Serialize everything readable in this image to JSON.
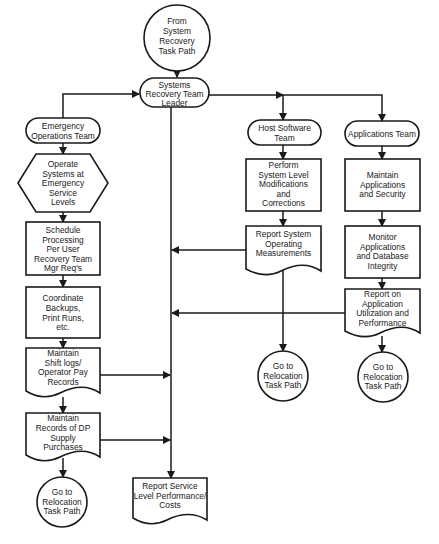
{
  "diagram": {
    "type": "flowchart",
    "nodes": {
      "start": {
        "shape": "circle",
        "lines": [
          "From",
          "System",
          "Recovery",
          "Task Path"
        ]
      },
      "leader": {
        "shape": "terminal",
        "lines": [
          "Systems",
          "Recovery Team",
          "Leader"
        ]
      },
      "emergency_team": {
        "shape": "terminal",
        "lines": [
          "Emergency",
          "Operations Team"
        ]
      },
      "operate": {
        "shape": "hexagon",
        "lines": [
          "Operate",
          "Systems at",
          "Emergency",
          "Service",
          "Levels"
        ]
      },
      "schedule": {
        "shape": "process",
        "lines": [
          "Schedule",
          "Processing",
          "Per User",
          "Recovery Team",
          "Mgr Req's"
        ]
      },
      "coordinate": {
        "shape": "process",
        "lines": [
          "Coordinate",
          "Backups,",
          "Print Runs,",
          "etc."
        ]
      },
      "shift_logs": {
        "shape": "document",
        "lines": [
          "Maintain",
          "Shift logs/",
          "Operator Pay",
          "Records"
        ]
      },
      "dp_supply": {
        "shape": "document",
        "lines": [
          "Maintain",
          "Records of DP",
          "Supply",
          "Purchases"
        ]
      },
      "goto_left": {
        "shape": "circle",
        "lines": [
          "Go to",
          "Relocation",
          "Task Path"
        ]
      },
      "report_service": {
        "shape": "document",
        "lines": [
          "Report Service",
          "Level Performance/",
          "Costs"
        ]
      },
      "host_team": {
        "shape": "terminal",
        "lines": [
          "Host Software",
          "Team"
        ]
      },
      "perform": {
        "shape": "process",
        "lines": [
          "Perform",
          "System Level",
          "Modifications",
          "and",
          "Corrections"
        ]
      },
      "report_system": {
        "shape": "document",
        "lines": [
          "Report System",
          "Operating",
          "Measurements"
        ]
      },
      "goto_host": {
        "shape": "circle",
        "lines": [
          "Go to",
          "Relocation",
          "Task Path"
        ]
      },
      "apps_team": {
        "shape": "terminal",
        "lines": [
          "Applications Team"
        ]
      },
      "maintain_apps": {
        "shape": "process",
        "lines": [
          "Maintain",
          "Applications",
          "and Security"
        ]
      },
      "monitor": {
        "shape": "process",
        "lines": [
          "Monitor",
          "Applications",
          "and Database",
          "Integrity"
        ]
      },
      "report_app": {
        "shape": "document",
        "lines": [
          "Report on",
          "Application",
          "Utilization and",
          "Performance"
        ]
      },
      "goto_app": {
        "shape": "circle",
        "lines": [
          "Go to",
          "Relocation",
          "Task Path"
        ]
      }
    },
    "edges": [
      [
        "start",
        "leader"
      ],
      [
        "emergency_team",
        "leader"
      ],
      [
        "leader",
        "host_team"
      ],
      [
        "leader",
        "apps_team"
      ],
      [
        "leader",
        "report_service"
      ],
      [
        "emergency_team",
        "operate"
      ],
      [
        "operate",
        "schedule"
      ],
      [
        "schedule",
        "coordinate"
      ],
      [
        "coordinate",
        "shift_logs"
      ],
      [
        "shift_logs",
        "dp_supply"
      ],
      [
        "shift_logs",
        "report_service"
      ],
      [
        "dp_supply",
        "goto_left"
      ],
      [
        "dp_supply",
        "report_service"
      ],
      [
        "host_team",
        "perform"
      ],
      [
        "perform",
        "report_system"
      ],
      [
        "report_system",
        "goto_host"
      ],
      [
        "report_system",
        "report_service"
      ],
      [
        "apps_team",
        "maintain_apps"
      ],
      [
        "maintain_apps",
        "monitor"
      ],
      [
        "monitor",
        "report_app"
      ],
      [
        "report_app",
        "goto_app"
      ],
      [
        "report_app",
        "report_service"
      ]
    ],
    "colors": {
      "stroke": "#1a1a1a",
      "fill": "#ffffff",
      "text": "#222222"
    }
  }
}
